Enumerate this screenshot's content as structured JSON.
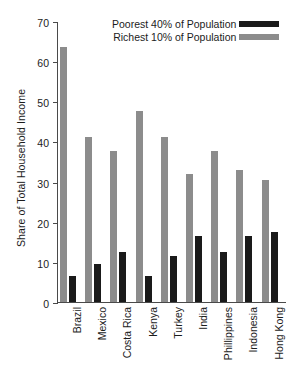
{
  "chart_data": {
    "type": "bar",
    "title": "",
    "subtitle": "",
    "xlabel": "",
    "ylabel": "Share of Total Household Income",
    "ylim": [
      0,
      70
    ],
    "yticks": [
      0,
      10,
      20,
      30,
      40,
      50,
      60,
      70
    ],
    "ytick_labels": [
      "0",
      "10",
      "20",
      "30",
      "40",
      "50",
      "60",
      "70"
    ],
    "grid": false,
    "legend_position": "top-right-inside",
    "categories": [
      "Brazil",
      "Mexico",
      "Costa Rica",
      "Kenya",
      "Turkey",
      "India",
      "Phillippines",
      "Indonesia",
      "Hong Kong"
    ],
    "series": [
      {
        "name": "Richest 10% of Population",
        "color": "#8c8c8c",
        "values": [
          63.5,
          41,
          37.5,
          47.5,
          41,
          32,
          37.5,
          33,
          30.5
        ]
      },
      {
        "name": "Poorest 40% of Population",
        "color": "#1a1a1a",
        "values": [
          6.5,
          9.5,
          12.5,
          6.5,
          11.5,
          16.5,
          12.5,
          16.5,
          17.5
        ]
      }
    ]
  },
  "legend": {
    "entries": [
      {
        "label": "Poorest 40% of Population",
        "swatch": "black-swatch",
        "kind": "poor"
      },
      {
        "label": "Richest 10% of Population",
        "swatch": "gray-swatch",
        "kind": "rich"
      }
    ]
  },
  "axis": {
    "y_title": "Share of Total Household Income"
  }
}
